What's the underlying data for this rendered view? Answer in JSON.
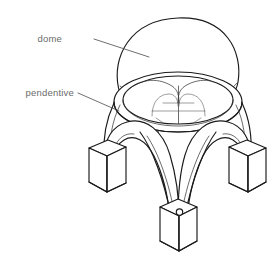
{
  "figure": {
    "kind": "architectural-line-drawing",
    "background_color": "#ffffff",
    "line_color": "#1a1a1a",
    "label_color": "#6b6b6b"
  },
  "labels": [
    {
      "id": "dome",
      "text": "dome",
      "text_x": 62,
      "text_y": 42,
      "leader_from_x": 94,
      "leader_from_y": 39,
      "leader_to_x": 149,
      "leader_to_y": 57
    },
    {
      "id": "pendentive",
      "text": "pendentive",
      "text_x": 14,
      "text_y": 96,
      "leader_from_x": 78,
      "leader_from_y": 93,
      "leader_to_x": 119,
      "leader_to_y": 111
    }
  ],
  "parts": {
    "dome_label": "dome",
    "pendentive_label": "pendentive",
    "dome_cap": "hemispherical dome cap",
    "cornice_ring": "elliptical cornice ring",
    "pendentive_left": "left pendentive spandrel",
    "pendentive_right": "right pendentive spandrel",
    "arch_left": "left supporting arch",
    "arch_right": "right supporting arch",
    "arch_front": "front supporting arch",
    "pier_left": "left pier",
    "pier_right": "right pier",
    "pier_front": "front pier"
  }
}
